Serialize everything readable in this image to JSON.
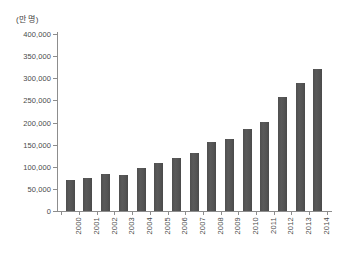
{
  "chart_data": {
    "type": "bar",
    "title": "",
    "subtitle": "",
    "xlabel": "",
    "ylabel": "(만 명)",
    "unit_caption": "(만 명)",
    "categories": [
      "2000",
      "2001",
      "2002",
      "2003",
      "2004",
      "2005",
      "2006",
      "2007",
      "2008",
      "2009",
      "2010",
      "2011",
      "2012",
      "2013",
      "2014"
    ],
    "values": [
      70000,
      75000,
      84000,
      82000,
      97000,
      108000,
      120000,
      131000,
      155000,
      163000,
      186000,
      202000,
      258000,
      290000,
      322000
    ],
    "ylim": [
      0,
      400000
    ],
    "ytick_values": [
      0,
      50000,
      100000,
      150000,
      200000,
      250000,
      300000,
      350000,
      400000
    ],
    "ytick_labels": [
      "0",
      "50,000",
      "100,000",
      "150,000",
      "200,000",
      "250,000",
      "300,000",
      "350,000",
      "400,000"
    ],
    "grid": false,
    "legend": null,
    "legend_position": "none",
    "annotations": [],
    "series": [
      {
        "name": "",
        "values": [
          70000,
          75000,
          84000,
          82000,
          97000,
          108000,
          120000,
          131000,
          155000,
          163000,
          186000,
          202000,
          258000,
          290000,
          322000
        ]
      }
    ]
  },
  "colors": {
    "bar": "#545454",
    "axis": "#8d8d8d",
    "text": "#4a4a4a",
    "background": "#ffffff"
  }
}
